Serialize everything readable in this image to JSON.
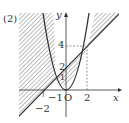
{
  "problem_label": "(2)",
  "axes": {
    "x_label": "x",
    "y_label": "y",
    "origin_label": "O"
  },
  "ticks": {
    "x_neg2": "−2",
    "x_neg1": "−1",
    "x_2": "2",
    "y_1": "1",
    "y_2": "2",
    "y_4": "4"
  },
  "curves": [
    {
      "name": "parabola",
      "equation": "y = x^2"
    },
    {
      "name": "line",
      "equation": "y = x + 2"
    }
  ],
  "intersections": [
    [
      -1,
      1
    ],
    [
      2,
      4
    ]
  ],
  "shading": "regions where (y - x^2)(y - x - 2) < 0",
  "colors": {
    "ink": "#333333",
    "hatch": "#888888"
  }
}
